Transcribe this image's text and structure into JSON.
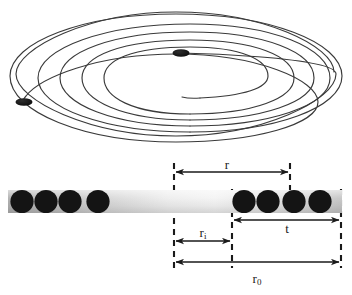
{
  "figure": {
    "background_color": "#ffffff",
    "line_color": "#3a3a3a",
    "dimension_line_color": "#1a1a1a",
    "conductor_color": "#141414",
    "substrate_gradient_from": "#b4b4b4",
    "substrate_gradient_to": "#f5f5f5"
  },
  "spiral": {
    "name": "planar-spiral-coil",
    "turns": 5,
    "perspective": "elliptical-oblique",
    "center_x": 176,
    "center_y": 72,
    "outer_radius_x": 160,
    "outer_radius_y": 64,
    "inner_radius_x": 52,
    "inner_radius_y": 21,
    "terminals": [
      {
        "name": "inner-terminal-dot",
        "x": 180,
        "y": 53,
        "rx": 8,
        "ry": 3.5
      },
      {
        "name": "outer-terminal-dot",
        "x": 24,
        "y": 102,
        "rx": 8,
        "ry": 3.5
      }
    ]
  },
  "cross_section": {
    "bar": {
      "x": 8,
      "y": 190,
      "width": 334,
      "height": 23
    },
    "conductor_radius": 11.5,
    "left_conductors_x": [
      22,
      46,
      70,
      98
    ],
    "right_conductors_x": [
      244,
      268,
      294,
      320
    ],
    "conductor_count_left": 4,
    "conductor_count_right": 4
  },
  "dashed_lines": [
    {
      "name": "dashed-line-inner-start",
      "x": 174,
      "y_top": 163,
      "y_bottom": 268
    },
    {
      "name": "dashed-line-conductor-start",
      "x": 232,
      "y_top": 188,
      "y_bottom": 268
    },
    {
      "name": "dashed-line-r-end",
      "x": 290,
      "y_top": 163,
      "y_bottom": 190
    },
    {
      "name": "dashed-line-outer-end",
      "x": 341,
      "y_top": 188,
      "y_bottom": 268
    }
  ],
  "dimensions": [
    {
      "id": "r",
      "label": "r",
      "subscript": "",
      "description": "mean radius",
      "y": 172,
      "x_start": 174,
      "x_end": 290
    },
    {
      "id": "ri",
      "label": "r",
      "subscript": "i",
      "description": "inner radius",
      "y": 241,
      "x_start": 174,
      "x_end": 232
    },
    {
      "id": "t",
      "label": "t",
      "subscript": "",
      "description": "winding thickness",
      "y": 220,
      "x_start": 232,
      "x_end": 341
    },
    {
      "id": "r0",
      "label": "r",
      "subscript": "0",
      "description": "outer radius",
      "y": 262,
      "x_start": 174,
      "x_end": 341
    }
  ]
}
